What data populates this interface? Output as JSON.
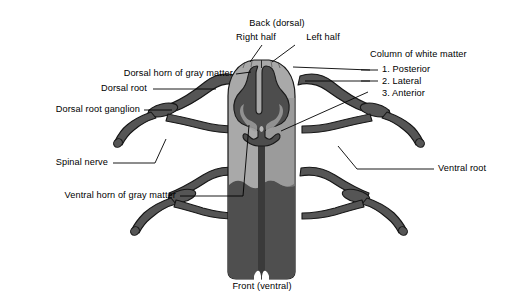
{
  "figure": {
    "colors": {
      "background": "#ffffff",
      "white_matter": "#a9a9a9",
      "gray_matter": "#4d4d4d",
      "cord_lower": "#4f4f4f",
      "nerve": "#555555",
      "outline": "#1a1a1a",
      "leader_line": "#000000",
      "text": "#000000"
    }
  },
  "labels": {
    "back_dorsal": "Back (dorsal)",
    "right_half": "Right half",
    "left_half": "Left half",
    "column_of_white_matter": "Column of white matter",
    "column_items": [
      "1. Posterior",
      "2. Lateral",
      "3. Anterior"
    ],
    "dorsal_horn": "Dorsal horn of gray matter",
    "dorsal_root": "Dorsal root",
    "dorsal_root_ganglion": "Dorsal root ganglion",
    "spinal_nerve": "Spinal nerve",
    "ventral_horn": "Ventral horn of gray matter",
    "ventral_root": "Ventral root",
    "front_ventral": "Front (ventral)"
  }
}
